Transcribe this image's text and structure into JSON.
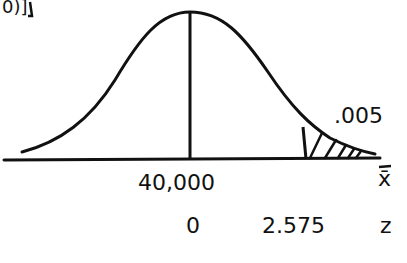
{
  "diagram": {
    "title_fragment": "0)]",
    "curve": "normal distribution curve",
    "mean_line": "vertical line at mean",
    "tail_area_label": ".005",
    "x_axis": {
      "variable": "x̄",
      "center_value": "40,000"
    },
    "z_axis": {
      "variable": "z",
      "center_value": "0",
      "critical_value": "2.575"
    },
    "shaded_region": "right tail beyond z = 2.575"
  }
}
